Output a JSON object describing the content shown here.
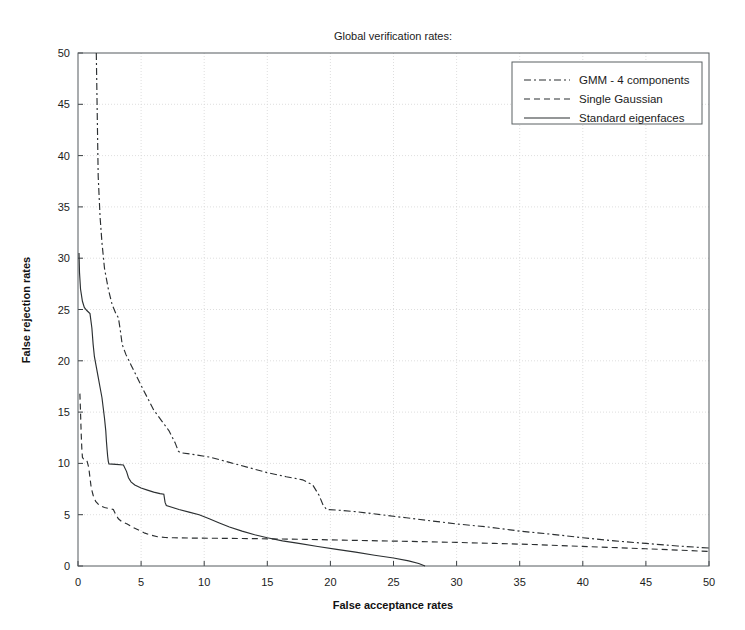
{
  "chart_data": {
    "type": "line",
    "title": "Global verification rates:",
    "xlabel": "False acceptance rates",
    "ylabel": "False rejection rates",
    "xlim": [
      0,
      50
    ],
    "ylim": [
      0,
      50
    ],
    "xticks": [
      0,
      5,
      10,
      15,
      20,
      25,
      30,
      35,
      40,
      45,
      50
    ],
    "yticks": [
      0,
      5,
      10,
      15,
      20,
      25,
      30,
      35,
      40,
      45,
      50
    ],
    "grid": true,
    "legend_position": "top-right",
    "series": [
      {
        "name": "GMM - 4 components",
        "style": "dashdot",
        "dasharray": "7 3 2 3",
        "color": "#2b2f31",
        "points": [
          [
            1.45,
            50.0
          ],
          [
            1.5,
            46.0
          ],
          [
            1.55,
            42.0
          ],
          [
            1.6,
            38.0
          ],
          [
            1.75,
            34.0
          ],
          [
            1.9,
            31.5
          ],
          [
            2.1,
            29.0
          ],
          [
            2.4,
            27.0
          ],
          [
            2.7,
            25.5
          ],
          [
            3.0,
            24.6
          ],
          [
            3.2,
            24.2
          ],
          [
            3.35,
            23.0
          ],
          [
            3.5,
            21.6
          ],
          [
            3.8,
            20.6
          ],
          [
            4.2,
            19.6
          ],
          [
            4.6,
            18.6
          ],
          [
            5.0,
            17.6
          ],
          [
            5.5,
            16.4
          ],
          [
            6.0,
            15.2
          ],
          [
            6.6,
            14.2
          ],
          [
            7.2,
            13.2
          ],
          [
            7.7,
            12.0
          ],
          [
            7.95,
            11.2
          ],
          [
            8.1,
            11.05
          ],
          [
            9.0,
            10.9
          ],
          [
            10.5,
            10.6
          ],
          [
            12.0,
            10.1
          ],
          [
            13.5,
            9.6
          ],
          [
            15.0,
            9.1
          ],
          [
            16.5,
            8.7
          ],
          [
            17.8,
            8.4
          ],
          [
            18.6,
            7.9
          ],
          [
            19.1,
            6.9
          ],
          [
            19.4,
            6.0
          ],
          [
            19.7,
            5.5
          ],
          [
            20.5,
            5.45
          ],
          [
            22.0,
            5.3
          ],
          [
            24.0,
            5.0
          ],
          [
            26.0,
            4.7
          ],
          [
            28.0,
            4.4
          ],
          [
            30.0,
            4.1
          ],
          [
            32.5,
            3.8
          ],
          [
            35.0,
            3.4
          ],
          [
            37.5,
            3.1
          ],
          [
            40.0,
            2.75
          ],
          [
            42.5,
            2.45
          ],
          [
            45.0,
            2.2
          ],
          [
            47.5,
            1.95
          ],
          [
            50.0,
            1.75
          ]
        ]
      },
      {
        "name": "Single Gaussian",
        "style": "dashed",
        "dasharray": "6 4",
        "color": "#2b2f31",
        "points": [
          [
            0.15,
            16.8
          ],
          [
            0.2,
            15.0
          ],
          [
            0.25,
            13.0
          ],
          [
            0.3,
            11.5
          ],
          [
            0.35,
            10.6
          ],
          [
            0.45,
            10.4
          ],
          [
            0.7,
            10.3
          ],
          [
            0.85,
            9.6
          ],
          [
            0.95,
            8.6
          ],
          [
            1.05,
            7.6
          ],
          [
            1.2,
            6.9
          ],
          [
            1.4,
            6.3
          ],
          [
            1.7,
            5.9
          ],
          [
            2.1,
            5.7
          ],
          [
            2.5,
            5.6
          ],
          [
            2.8,
            5.5
          ],
          [
            3.0,
            5.0
          ],
          [
            3.2,
            4.6
          ],
          [
            3.5,
            4.3
          ],
          [
            3.9,
            4.1
          ],
          [
            4.3,
            3.8
          ],
          [
            4.8,
            3.5
          ],
          [
            5.3,
            3.2
          ],
          [
            5.8,
            3.0
          ],
          [
            6.3,
            2.85
          ],
          [
            6.9,
            2.78
          ],
          [
            7.6,
            2.75
          ],
          [
            9.0,
            2.72
          ],
          [
            11.0,
            2.7
          ],
          [
            13.0,
            2.68
          ],
          [
            15.0,
            2.65
          ],
          [
            18.0,
            2.6
          ],
          [
            21.0,
            2.52
          ],
          [
            24.0,
            2.45
          ],
          [
            27.0,
            2.38
          ],
          [
            30.0,
            2.3
          ],
          [
            33.0,
            2.2
          ],
          [
            36.0,
            2.1
          ],
          [
            39.0,
            1.95
          ],
          [
            42.0,
            1.82
          ],
          [
            45.0,
            1.68
          ],
          [
            47.5,
            1.55
          ],
          [
            50.0,
            1.42
          ]
        ]
      },
      {
        "name": "Standard eigenfaces",
        "style": "solid",
        "dasharray": "",
        "color": "#2b2f31",
        "points": [
          [
            0.08,
            30.5
          ],
          [
            0.12,
            28.6
          ],
          [
            0.2,
            27.0
          ],
          [
            0.35,
            25.8
          ],
          [
            0.5,
            25.2
          ],
          [
            0.7,
            24.9
          ],
          [
            0.95,
            24.6
          ],
          [
            1.1,
            23.2
          ],
          [
            1.2,
            21.6
          ],
          [
            1.3,
            20.4
          ],
          [
            1.45,
            19.4
          ],
          [
            1.6,
            18.4
          ],
          [
            1.75,
            17.4
          ],
          [
            1.9,
            16.4
          ],
          [
            2.0,
            15.4
          ],
          [
            2.1,
            14.4
          ],
          [
            2.2,
            13.2
          ],
          [
            2.25,
            12.2
          ],
          [
            2.3,
            11.4
          ],
          [
            2.35,
            10.7
          ],
          [
            2.4,
            10.2
          ],
          [
            2.45,
            9.95
          ],
          [
            3.0,
            9.9
          ],
          [
            3.6,
            9.85
          ],
          [
            3.85,
            9.2
          ],
          [
            4.0,
            8.6
          ],
          [
            4.2,
            8.2
          ],
          [
            4.5,
            7.9
          ],
          [
            5.0,
            7.6
          ],
          [
            5.5,
            7.4
          ],
          [
            6.0,
            7.2
          ],
          [
            6.5,
            7.05
          ],
          [
            6.8,
            7.0
          ],
          [
            6.9,
            6.2
          ],
          [
            7.0,
            5.9
          ],
          [
            7.5,
            5.7
          ],
          [
            8.0,
            5.5
          ],
          [
            8.8,
            5.25
          ],
          [
            9.6,
            5.0
          ],
          [
            10.4,
            4.6
          ],
          [
            11.2,
            4.2
          ],
          [
            12.0,
            3.8
          ],
          [
            13.0,
            3.4
          ],
          [
            14.0,
            3.05
          ],
          [
            15.0,
            2.75
          ],
          [
            16.2,
            2.45
          ],
          [
            17.5,
            2.2
          ],
          [
            19.0,
            1.9
          ],
          [
            20.5,
            1.62
          ],
          [
            22.0,
            1.35
          ],
          [
            23.5,
            1.05
          ],
          [
            25.0,
            0.78
          ],
          [
            26.2,
            0.5
          ],
          [
            27.0,
            0.25
          ],
          [
            27.5,
            0.0
          ]
        ]
      }
    ]
  },
  "legend": {
    "items": [
      {
        "label": "GMM - 4 components"
      },
      {
        "label": "Single Gaussian"
      },
      {
        "label": "Standard eigenfaces"
      }
    ]
  }
}
